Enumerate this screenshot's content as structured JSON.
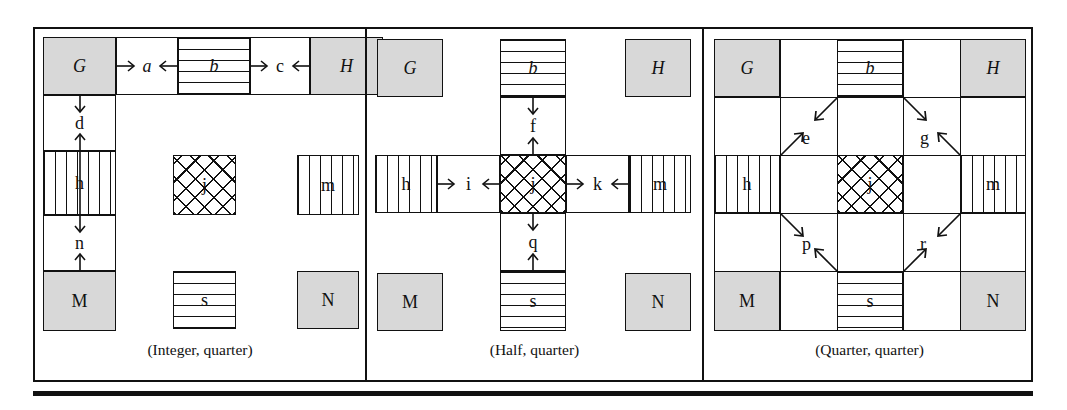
{
  "figure": {
    "panels": [
      {
        "id": "integer-quarter",
        "caption": "(Integer, quarter)",
        "layout": "L-shaped contiguous band along top row and left column",
        "blocks": [
          {
            "key": "G",
            "label": "G",
            "style": "italic",
            "fill": "gray",
            "role": "corner-region"
          },
          {
            "key": "a",
            "label": "a",
            "style": "italic",
            "fill": "plain",
            "role": "gap-region"
          },
          {
            "key": "b",
            "label": "b",
            "style": "italic",
            "fill": "hstripe",
            "role": "edge-region"
          },
          {
            "key": "c",
            "label": "c",
            "style": "roman",
            "fill": "plain",
            "role": "gap-region"
          },
          {
            "key": "H",
            "label": "H",
            "style": "italic",
            "fill": "gray",
            "role": "corner-region"
          },
          {
            "key": "d",
            "label": "d",
            "style": "roman",
            "fill": "plain",
            "role": "gap-region"
          },
          {
            "key": "h",
            "label": "h",
            "style": "roman",
            "fill": "vstripe",
            "role": "edge-region"
          },
          {
            "key": "n",
            "label": "n",
            "style": "roman",
            "fill": "plain",
            "role": "gap-region"
          },
          {
            "key": "M",
            "label": "M",
            "style": "roman",
            "fill": "gray",
            "role": "corner-region"
          },
          {
            "key": "j",
            "label": "j",
            "style": "roman",
            "fill": "crosshatch",
            "role": "center-region"
          },
          {
            "key": "m",
            "label": "m",
            "style": "roman",
            "fill": "vstripe",
            "role": "edge-region"
          },
          {
            "key": "s",
            "label": "s",
            "style": "roman",
            "fill": "hstripe",
            "role": "edge-region"
          },
          {
            "key": "N",
            "label": "N",
            "style": "roman",
            "fill": "gray",
            "role": "corner-region"
          }
        ],
        "arrows": [
          {
            "at": "a",
            "orientation": "horizontal",
            "kind": "inward-pair"
          },
          {
            "at": "c",
            "orientation": "horizontal",
            "kind": "inward-pair"
          },
          {
            "at": "d",
            "orientation": "vertical",
            "kind": "inward-pair"
          },
          {
            "at": "n",
            "orientation": "vertical",
            "kind": "inward-pair"
          }
        ]
      },
      {
        "id": "half-quarter",
        "caption": "(Half, quarter)",
        "layout": "plus/cross shaped contiguous band through the centre",
        "blocks": [
          {
            "key": "G",
            "label": "G",
            "style": "italic",
            "fill": "gray",
            "role": "corner-region"
          },
          {
            "key": "H",
            "label": "H",
            "style": "italic",
            "fill": "gray",
            "role": "corner-region"
          },
          {
            "key": "M",
            "label": "M",
            "style": "roman",
            "fill": "gray",
            "role": "corner-region"
          },
          {
            "key": "N",
            "label": "N",
            "style": "roman",
            "fill": "gray",
            "role": "corner-region"
          },
          {
            "key": "b",
            "label": "b",
            "style": "italic",
            "fill": "hstripe",
            "role": "edge-region"
          },
          {
            "key": "f",
            "label": "f",
            "style": "roman",
            "fill": "plain",
            "role": "gap-region"
          },
          {
            "key": "h",
            "label": "h",
            "style": "roman",
            "fill": "vstripe",
            "role": "edge-region"
          },
          {
            "key": "i",
            "label": "i",
            "style": "roman",
            "fill": "plain",
            "role": "gap-region"
          },
          {
            "key": "j",
            "label": "j",
            "style": "roman",
            "fill": "crosshatch",
            "role": "center-region"
          },
          {
            "key": "k",
            "label": "k",
            "style": "roman",
            "fill": "plain",
            "role": "gap-region"
          },
          {
            "key": "m",
            "label": "m",
            "style": "roman",
            "fill": "vstripe",
            "role": "edge-region"
          },
          {
            "key": "q",
            "label": "q",
            "style": "roman",
            "fill": "plain",
            "role": "gap-region"
          },
          {
            "key": "s",
            "label": "s",
            "style": "roman",
            "fill": "hstripe",
            "role": "edge-region"
          }
        ],
        "arrows": [
          {
            "at": "f",
            "orientation": "vertical",
            "kind": "inward-pair"
          },
          {
            "at": "q",
            "orientation": "vertical",
            "kind": "inward-pair"
          },
          {
            "at": "i",
            "orientation": "horizontal",
            "kind": "inward-pair"
          },
          {
            "at": "k",
            "orientation": "horizontal",
            "kind": "inward-pair"
          }
        ]
      },
      {
        "id": "quarter-quarter",
        "caption": "(Quarter, quarter)",
        "layout": "full 3x3 grid, diagonal gap regions between corners and centre band",
        "blocks": [
          {
            "key": "G",
            "label": "G",
            "style": "italic",
            "fill": "gray",
            "role": "corner-region"
          },
          {
            "key": "H",
            "label": "H",
            "style": "italic",
            "fill": "gray",
            "role": "corner-region"
          },
          {
            "key": "M",
            "label": "M",
            "style": "roman",
            "fill": "gray",
            "role": "corner-region"
          },
          {
            "key": "N",
            "label": "N",
            "style": "roman",
            "fill": "gray",
            "role": "corner-region"
          },
          {
            "key": "b",
            "label": "b",
            "style": "italic",
            "fill": "hstripe",
            "role": "edge-region"
          },
          {
            "key": "h",
            "label": "h",
            "style": "roman",
            "fill": "vstripe",
            "role": "edge-region"
          },
          {
            "key": "m",
            "label": "m",
            "style": "roman",
            "fill": "vstripe",
            "role": "edge-region"
          },
          {
            "key": "s",
            "label": "s",
            "style": "roman",
            "fill": "hstripe",
            "role": "edge-region"
          },
          {
            "key": "j",
            "label": "j",
            "style": "roman",
            "fill": "crosshatch",
            "role": "center-region"
          },
          {
            "key": "e",
            "label": "e",
            "style": "roman",
            "fill": "plain",
            "role": "diagonal-gap-region"
          },
          {
            "key": "g",
            "label": "g",
            "style": "roman",
            "fill": "plain",
            "role": "diagonal-gap-region"
          },
          {
            "key": "p",
            "label": "p",
            "style": "roman",
            "fill": "plain",
            "role": "diagonal-gap-region"
          },
          {
            "key": "r",
            "label": "r",
            "style": "roman",
            "fill": "plain",
            "role": "diagonal-gap-region"
          }
        ],
        "arrows": [
          {
            "at": "e",
            "orientation": "diagonal-nesw",
            "kind": "inward-pair"
          },
          {
            "at": "g",
            "orientation": "diagonal-nwse",
            "kind": "inward-pair"
          },
          {
            "at": "p",
            "orientation": "diagonal-nwse",
            "kind": "inward-pair"
          },
          {
            "at": "r",
            "orientation": "diagonal-nesw",
            "kind": "inward-pair"
          }
        ]
      }
    ],
    "legend": {
      "gray_fill": "#d8d8d8",
      "line_color": "#111111",
      "background": "#ffffff"
    }
  }
}
